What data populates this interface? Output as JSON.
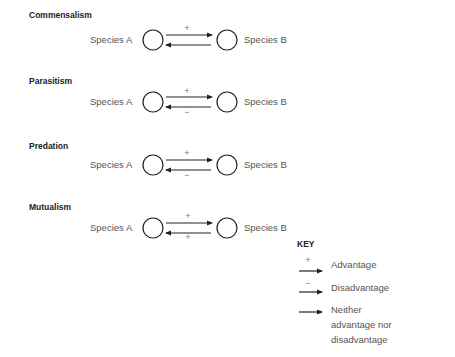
{
  "relationships": [
    {
      "name": "Commensalism",
      "species_a": "Species A",
      "species_b": "Species B",
      "a_to_b_sign": "+",
      "b_to_a_sign": ""
    },
    {
      "name": "Parasitism",
      "species_a": "Species A",
      "species_b": "Species B",
      "a_to_b_sign": "+",
      "b_to_a_sign": "−"
    },
    {
      "name": "Predation",
      "species_a": "Species A",
      "species_b": "Species B",
      "a_to_b_sign": "+",
      "b_to_a_sign": "−"
    },
    {
      "name": "Mutualism",
      "species_a": "Species A",
      "species_b": "Species B",
      "a_to_b_sign": "+",
      "b_to_a_sign": "+"
    }
  ],
  "key": {
    "title": "KEY",
    "items": [
      {
        "sign": "+",
        "label": "Advantage"
      },
      {
        "sign": "−",
        "label": "Disadvantage"
      },
      {
        "sign": "",
        "label": "Neither advantage nor disadvantage"
      }
    ]
  },
  "colors": {
    "line": "#222222",
    "text": "#555555",
    "sign": "#777777"
  }
}
